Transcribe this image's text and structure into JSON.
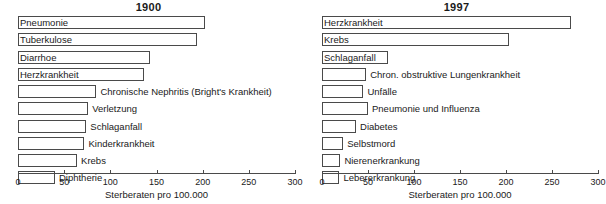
{
  "chart_data": [
    {
      "type": "bar",
      "title": "1900",
      "xlabel": "Sterberaten pro 100.000",
      "ylabel": "",
      "xlim": [
        0,
        300
      ],
      "xticks": [
        0,
        50,
        100,
        150,
        200,
        250,
        300
      ],
      "grid": false,
      "legend": "none",
      "orientation": "horizontal",
      "categories": [
        "Pneumonie",
        "Tuberkulose",
        "Diarrhoe",
        "Herzkrankheit",
        "Chronische Nephritis (Bright's Krankheit)",
        "Verletzung",
        "Schlaganfall",
        "Kinderkrankheit",
        "Krebs",
        "Diphtherie"
      ],
      "values": [
        202,
        194,
        143,
        137,
        85,
        76,
        74,
        72,
        64,
        40
      ],
      "label_placement": [
        "inside",
        "inside",
        "inside",
        "inside",
        "outside",
        "outside",
        "outside",
        "outside",
        "outside",
        "outside"
      ]
    },
    {
      "type": "bar",
      "title": "1997",
      "xlabel": "Sterberaten pro 100.000",
      "ylabel": "",
      "xlim": [
        0,
        300
      ],
      "xticks": [
        0,
        50,
        100,
        150,
        200,
        250,
        300
      ],
      "grid": false,
      "legend": "none",
      "orientation": "horizontal",
      "categories": [
        "Herzkrankheit",
        "Krebs",
        "Schlaganfall",
        "Chron. obstruktive Lungenkrankheit",
        "Unfälle",
        "Pneumonie und Influenza",
        "Diabetes",
        "Selbstmord",
        "Nierenerkrankung",
        "Lebererkrankung"
      ],
      "values": [
        271,
        203,
        72,
        48,
        45,
        50,
        37,
        23,
        20,
        19
      ],
      "label_placement": [
        "inside",
        "inside",
        "inside",
        "outside",
        "outside",
        "outside",
        "outside",
        "outside",
        "outside",
        "outside"
      ]
    }
  ],
  "colors": {
    "bar_fill": "#ffffff",
    "bar_stroke": "#4a4a4a",
    "text": "#1a1a1a",
    "background": "#ffffff"
  }
}
